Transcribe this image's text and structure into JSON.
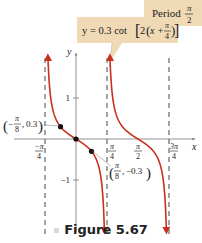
{
  "chart_data": {
    "type": "line",
    "title": "",
    "function": "y = 0.3 cot[2(x + π/4)]",
    "xlabel": "x",
    "ylabel": "y",
    "xlim_pi_units": [
      -0.5,
      1.0
    ],
    "ylim": [
      -2.3,
      2.0
    ],
    "grid": false,
    "x_ticks": [
      {
        "value_pi": -0.25,
        "num": "π",
        "den": "4",
        "neg": true
      },
      {
        "value_pi": 0.25,
        "num": "π",
        "den": "4",
        "neg": false
      },
      {
        "value_pi": 0.5,
        "num": "π",
        "den": "2",
        "neg": false
      },
      {
        "value_pi": 0.75,
        "num": "3π",
        "den": "4",
        "neg": false
      }
    ],
    "y_ticks": [
      {
        "value": 1,
        "label": "1"
      },
      {
        "value": -1,
        "label": "−1"
      }
    ],
    "asymptotes_pi": [
      -0.25,
      0.25,
      0.75
    ],
    "series": [
      {
        "name": "branch-1",
        "domain_pi": [
          -0.25,
          0.25
        ]
      },
      {
        "name": "branch-2",
        "domain_pi": [
          0.25,
          0.75
        ]
      }
    ],
    "points": [
      {
        "x_pi": -0.125,
        "y": 0.3,
        "label": "(−π/8, 0.3)"
      },
      {
        "x_pi": 0,
        "y": 0,
        "label": ""
      },
      {
        "x_pi": 0.125,
        "y": -0.3,
        "label": "(π/8, −0.3)"
      }
    ],
    "annotations": {
      "equation": {
        "lhs": "y = 0.3 cot",
        "inner": "2",
        "var": "x +",
        "frac_num": "π",
        "frac_den": "4"
      },
      "period": {
        "text": "Period",
        "frac_num": "π",
        "frac_den": "2"
      },
      "point_left": {
        "num": "π",
        "den": "8",
        "value": "0.3",
        "neg": "−"
      },
      "point_right": {
        "num": "π",
        "den": "8",
        "value": "−0.3"
      }
    },
    "colors": {
      "curve": "#c8301e",
      "axis": "#777777",
      "label_box": "#f0d9b5",
      "dash": "#333333"
    }
  },
  "caption": "Figure 5.67"
}
